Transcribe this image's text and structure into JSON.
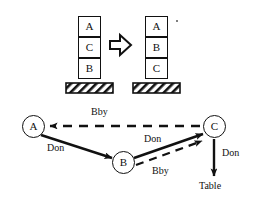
{
  "diagram": {
    "colors": {
      "stroke": "#111111",
      "background": "#ffffff",
      "hatch": "#111111"
    }
  },
  "states": {
    "transition_arrow": "block-arrow-right",
    "initial": {
      "name": "initial-state",
      "blocks_top_to_bottom": [
        "A",
        "C",
        "B"
      ],
      "support": "table"
    },
    "goal": {
      "name": "goal-state",
      "blocks_top_to_bottom": [
        "A",
        "B",
        "C"
      ],
      "support": "table"
    }
  },
  "graph": {
    "nodes": [
      {
        "id": "A",
        "label": "A"
      },
      {
        "id": "B",
        "label": "B"
      },
      {
        "id": "C",
        "label": "C"
      },
      {
        "id": "Table",
        "label": "Table"
      }
    ],
    "edges": [
      {
        "from": "C",
        "to": "A",
        "label": "Bby",
        "style": "dashed"
      },
      {
        "from": "A",
        "to": "B",
        "label": "Don",
        "style": "solid"
      },
      {
        "from": "B",
        "to": "C",
        "label": "Don",
        "style": "solid"
      },
      {
        "from": "B",
        "to": "C",
        "label": "Bby",
        "style": "dashed"
      },
      {
        "from": "C",
        "to": "Table",
        "label": "Don",
        "style": "solid"
      }
    ],
    "edge_labels": {
      "top_dashed": "Bby",
      "left_solid": "Don",
      "mid_solid": "Don",
      "mid_dashed": "Bby",
      "right_solid": "Don"
    }
  }
}
